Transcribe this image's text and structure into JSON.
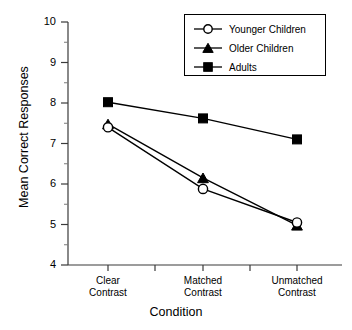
{
  "chart_data": {
    "type": "line",
    "title": "",
    "xlabel": "Condition",
    "ylabel": "Mean Correct Responses",
    "categories": [
      "Clear Contrast",
      "Matched Contrast",
      "Unmatched Contrast"
    ],
    "category_lines": [
      [
        "Clear",
        "Contrast"
      ],
      [
        "Matched",
        "Contrast"
      ],
      [
        "Unmatched",
        "Contrast"
      ]
    ],
    "ylim": [
      4,
      10
    ],
    "yticks": [
      4,
      5,
      6,
      7,
      8,
      9,
      10
    ],
    "ytick_labels": [
      "4",
      "5",
      "6",
      "7",
      "8",
      "9",
      "10"
    ],
    "minor_ticks": true,
    "grid": false,
    "legend_position": "top-right",
    "series": [
      {
        "name": "Younger Children",
        "marker": "open-circle",
        "values": [
          7.4,
          5.88,
          5.05
        ]
      },
      {
        "name": "Older Children",
        "marker": "filled-triangle",
        "values": [
          7.48,
          6.15,
          4.98
        ]
      },
      {
        "name": "Adults",
        "marker": "filled-square",
        "values": [
          8.02,
          7.62,
          7.1
        ]
      }
    ]
  },
  "colors": {
    "line": "#000000",
    "marker_fill": "#000000",
    "marker_open_fill": "#ffffff",
    "axis": "#3a3a3a",
    "background": "#ffffff"
  },
  "legend": {
    "items": [
      {
        "label": "Younger Children",
        "marker": "open-circle"
      },
      {
        "label": "Older Children",
        "marker": "filled-triangle"
      },
      {
        "label": "Adults",
        "marker": "filled-square"
      }
    ]
  }
}
